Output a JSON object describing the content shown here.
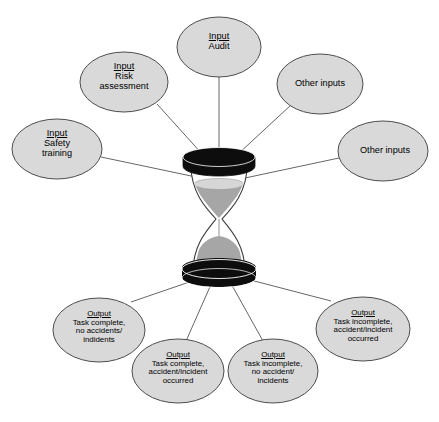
{
  "diagram": {
    "type": "hourglass-input-output-diagram",
    "background_color": "#ffffff",
    "node_fill": "#d9d9d9",
    "node_stroke": "#4d4d4d",
    "line_color": "#555555",
    "sand_color": "#a6a6a6",
    "sand_top_color": "#d4d4d4",
    "cap_color": "#0d0d0d",
    "center": {
      "name": "hourglass",
      "description": "hourglass"
    },
    "inputs": [
      {
        "id": "input-audit",
        "header": "Input",
        "lines": [
          "Audit"
        ],
        "cx": 219,
        "cy": 47,
        "rx": 42,
        "ry": 30
      },
      {
        "id": "input-risk-assessment",
        "header": "Input",
        "lines": [
          "Risk",
          "assessment"
        ],
        "cx": 124,
        "cy": 82,
        "rx": 44,
        "ry": 30
      },
      {
        "id": "input-safety-training",
        "header": "Input",
        "lines": [
          "Safety",
          "training"
        ],
        "cx": 57,
        "cy": 149,
        "rx": 45,
        "ry": 30
      },
      {
        "id": "other-inputs-top",
        "header": "",
        "lines": [
          "Other inputs"
        ],
        "cx": 320,
        "cy": 84,
        "rx": 43,
        "ry": 30
      },
      {
        "id": "other-inputs-right",
        "header": "",
        "lines": [
          "Other inputs"
        ],
        "cx": 383,
        "cy": 151,
        "rx": 45,
        "ry": 30
      }
    ],
    "outputs": [
      {
        "id": "output-complete-no-accidents",
        "header": "Output",
        "lines": [
          "Task complete,",
          "no accidents/",
          "indidents"
        ],
        "cx": 99,
        "cy": 330,
        "rx": 46,
        "ry": 32
      },
      {
        "id": "output-complete-accident-occurred",
        "header": "Output",
        "lines": [
          "Task complete,",
          "accident/incident",
          "occurred"
        ],
        "cx": 178,
        "cy": 371,
        "rx": 46,
        "ry": 32
      },
      {
        "id": "output-incomplete-no-accident",
        "header": "Output",
        "lines": [
          "Task incomplete,",
          "no accident/",
          "incidents"
        ],
        "cx": 273,
        "cy": 371,
        "rx": 45,
        "ry": 32
      },
      {
        "id": "output-incomplete-accident-occurred",
        "header": "Output",
        "lines": [
          "Task incomplete,",
          "accident/incident",
          "occurred"
        ],
        "cx": 363,
        "cy": 329,
        "rx": 47,
        "ry": 32
      }
    ],
    "connectors": [
      {
        "id": "conn-input-audit",
        "x1": 219,
        "x2": 219,
        "y1": 77,
        "y2": 158
      },
      {
        "id": "conn-input-risk",
        "x1": 157,
        "x2": 203,
        "y1": 104,
        "y2": 155
      },
      {
        "id": "conn-input-safety",
        "x1": 101,
        "x2": 196,
        "y1": 157,
        "y2": 177
      },
      {
        "id": "conn-other-inputs-top",
        "x1": 291,
        "x2": 237,
        "y1": 105,
        "y2": 155
      },
      {
        "id": "conn-other-inputs-right",
        "x1": 339,
        "x2": 244,
        "y1": 158,
        "y2": 178
      },
      {
        "id": "conn-output-1",
        "x1": 204,
        "x2": 131,
        "y1": 277,
        "y2": 302
      },
      {
        "id": "conn-output-2",
        "x1": 213,
        "x2": 186,
        "y1": 280,
        "y2": 340
      },
      {
        "id": "conn-output-3",
        "x1": 229,
        "x2": 263,
        "y1": 280,
        "y2": 340
      },
      {
        "id": "conn-output-4",
        "x1": 239,
        "x2": 331,
        "y1": 277,
        "y2": 301
      }
    ]
  }
}
